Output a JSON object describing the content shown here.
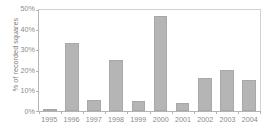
{
  "chart_data": {
    "type": "bar",
    "title": "",
    "xlabel": "",
    "ylabel": "% of recorded squares",
    "categories": [
      "1995",
      "1996",
      "1997",
      "1998",
      "1999",
      "2000",
      "2001",
      "2002",
      "2003",
      "2004"
    ],
    "values": [
      0.8,
      33.8,
      5.5,
      25.3,
      4.8,
      46.8,
      3.8,
      16.3,
      20.5,
      15.5
    ],
    "ylim": [
      0,
      50
    ],
    "ytick_values": [
      0,
      10,
      20,
      30,
      40,
      50
    ],
    "ytick_labels": [
      "0%",
      "10%",
      "20%",
      "30%",
      "40%",
      "50%"
    ],
    "grid": false,
    "legend": null,
    "bar_color": "#b5b5b5",
    "bar_edge_color": "#a8a8a8",
    "axis_color": "#b4b4b4",
    "text_color": "#8a8a8a"
  }
}
